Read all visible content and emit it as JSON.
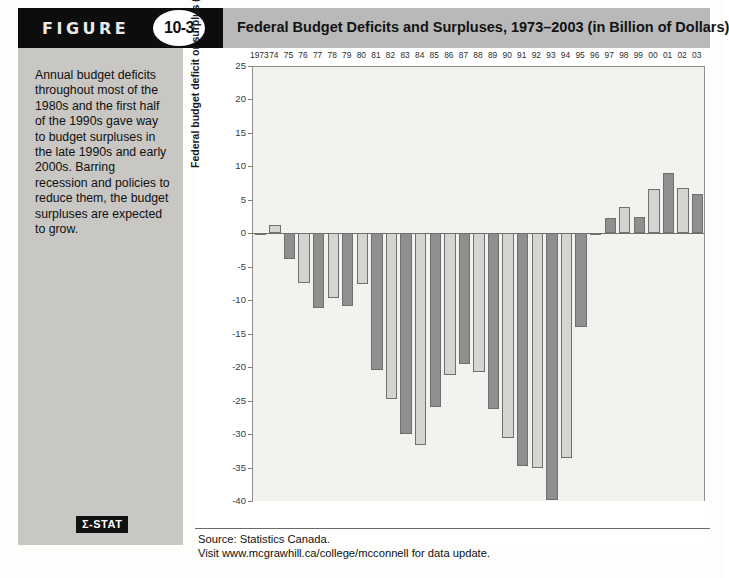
{
  "figure": {
    "label": "FIGURE",
    "number": "10-3",
    "title": "Federal Budget Deficits and Surpluses, 1973–2003 (in Billion of Dollars)"
  },
  "sidebar": {
    "caption": "Annual budget deficits throughout most of the 1980s and the first half of the 1990s gave way to budget surpluses in the late 1990s and early 2000s. Barring recession and policies to reduce them, the budget surpluses are expected to grow.",
    "logo": "Σ-STAT"
  },
  "source": {
    "line1": "Source: Statistics Canada.",
    "line2": "Visit www.mcgrawhill.ca/college/mcconnell for data update."
  },
  "colors": {
    "header_dark": "#0d0d0d",
    "header_gray": "#b9b9b9",
    "sidebar_gray": "#c8c7c3",
    "plot_bg": "#f2f2ef",
    "bar_light": "#d4d4d0",
    "bar_dark": "#8f8f8f",
    "axis": "#6f6f6f"
  },
  "chart_data": {
    "type": "bar",
    "title": "Federal Budget Deficits and Surpluses, 1973–2003 (in Billion of Dollars)",
    "xlabel": "",
    "ylabel": "Federal budget deficit or surplus (billions of dollars)",
    "ylim": [
      -40,
      25
    ],
    "ytick_step": 5,
    "yticks": [
      25,
      20,
      15,
      10,
      5,
      0,
      -5,
      -10,
      -15,
      -20,
      -25,
      -30,
      -35,
      -40
    ],
    "ytick_labels": [
      "25",
      "20",
      "15",
      "10",
      "5",
      "0",
      "-5",
      "-10",
      "-15",
      "-20",
      "-25",
      "-30",
      "-35",
      "-40"
    ],
    "grid": false,
    "legend": "none",
    "categories": [
      "1973",
      "74",
      "75",
      "76",
      "77",
      "78",
      "79",
      "80",
      "81",
      "82",
      "83",
      "84",
      "85",
      "86",
      "87",
      "88",
      "89",
      "90",
      "91",
      "92",
      "93",
      "94",
      "95",
      "96",
      "97",
      "98",
      "99",
      "00",
      "01",
      "02",
      "03"
    ],
    "values": [
      -0.3,
      1.2,
      -3.8,
      -7.5,
      -11.1,
      -9.7,
      -10.9,
      -7.6,
      -20.4,
      -24.7,
      -30.0,
      -31.7,
      -25.9,
      -21.1,
      -19.5,
      -20.8,
      -26.2,
      -30.6,
      -34.8,
      -35.1,
      -39.9,
      -33.6,
      -14.0,
      -0.0,
      2.3,
      4.0,
      2.5,
      6.6,
      9.0,
      6.8,
      5.8
    ],
    "years_full": [
      1973,
      1974,
      1975,
      1976,
      1977,
      1978,
      1979,
      1980,
      1981,
      1982,
      1983,
      1984,
      1985,
      1986,
      1987,
      1988,
      1989,
      1990,
      1991,
      1992,
      1993,
      1994,
      1995,
      1996,
      1997,
      1998,
      1999,
      2000,
      2001,
      2002,
      2003
    ],
    "bar_shades": [
      "dark",
      "light",
      "dark",
      "light",
      "dark",
      "light",
      "dark",
      "light",
      "dark",
      "light",
      "dark",
      "light",
      "dark",
      "light",
      "dark",
      "light",
      "dark",
      "light",
      "dark",
      "light",
      "dark",
      "light",
      "dark",
      "light",
      "dark",
      "light",
      "dark",
      "light",
      "dark",
      "light",
      "dark"
    ]
  }
}
